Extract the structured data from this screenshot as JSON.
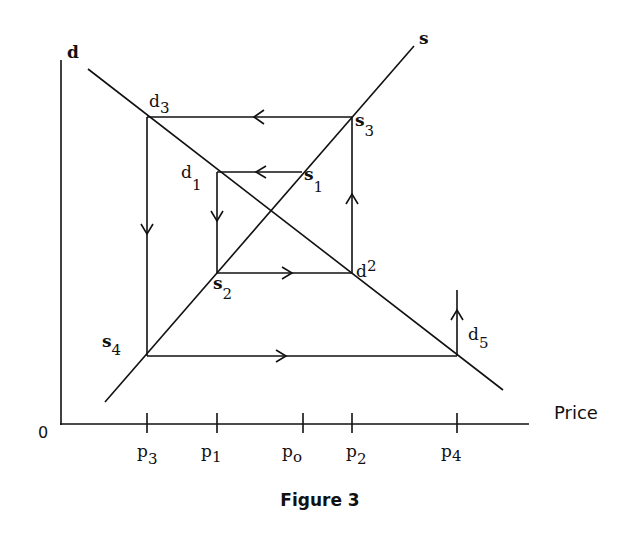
{
  "figure": {
    "caption": "Figure 3",
    "x_axis_title": "Price",
    "origin_label": "0",
    "curves": {
      "demand": {
        "label": "d",
        "from": [
          88,
          69
        ],
        "to": [
          503,
          390
        ]
      },
      "supply": {
        "label": "s",
        "from": [
          105,
          402
        ],
        "to": [
          414,
          46
        ]
      }
    },
    "x_ticks": [
      {
        "label": "p",
        "sub": "3",
        "x": 147
      },
      {
        "label": "p",
        "sub": "1",
        "x": 217
      },
      {
        "label": "p",
        "sub": "o",
        "x": 303
      },
      {
        "label": "p",
        "sub": "2",
        "x": 352
      },
      {
        "label": "p",
        "sub": "4",
        "x": 457
      }
    ],
    "points": {
      "d3": {
        "base": "d",
        "sub": "3"
      },
      "s3": {
        "base": "s",
        "sub": "3"
      },
      "d1": {
        "base": "d",
        "sub": "1"
      },
      "s1": {
        "base": "s",
        "sub": "1"
      },
      "s2": {
        "base": "s",
        "sub": "2"
      },
      "d2": {
        "base": "d",
        "sub": "2"
      },
      "s4": {
        "base": "s",
        "sub": "4"
      },
      "d5": {
        "base": "d",
        "sub": "5"
      }
    },
    "path_description": "Cobweb cycle: s1→d1→s2→d2→s3→d3→s4→d5→(up)",
    "colors": {
      "ink": "#111111",
      "background": "#ffffff"
    }
  }
}
